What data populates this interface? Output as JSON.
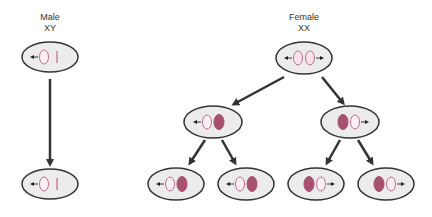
{
  "labels": {
    "male": {
      "title": "Male",
      "genotype": "XY"
    },
    "female": {
      "title": "Female",
      "genotype": "XX"
    }
  },
  "colors": {
    "cell_fill": "#ececec",
    "cell_stroke": "#333333",
    "x_active_fill": "#fbe3ea",
    "x_active_stroke": "#c06a88",
    "x_inactive_fill": "#a8506f",
    "arrow": "#333333"
  },
  "cells": [
    {
      "id": "male-parent",
      "cx": 50,
      "cy": 57,
      "sex": "male",
      "chromosomes": [
        "X-active",
        "Y"
      ],
      "arrow": "left"
    },
    {
      "id": "male-child",
      "cx": 50,
      "cy": 184,
      "sex": "male",
      "chromosomes": [
        "X-active",
        "Y"
      ],
      "arrow": "left"
    },
    {
      "id": "female-parent",
      "cx": 304,
      "cy": 58,
      "sex": "female",
      "chromosomes": [
        "X-active",
        "X-active"
      ],
      "arrow": "both"
    },
    {
      "id": "female-mid-left",
      "cx": 213,
      "cy": 122,
      "chromosomes": [
        "X-active",
        "X-inactive"
      ],
      "arrow": "left"
    },
    {
      "id": "female-mid-right",
      "cx": 350,
      "cy": 122,
      "chromosomes": [
        "X-inactive",
        "X-active"
      ],
      "arrow": "right"
    },
    {
      "id": "female-bottom-1",
      "cx": 176,
      "cy": 184,
      "chromosomes": [
        "X-active",
        "X-inactive"
      ],
      "arrow": "left"
    },
    {
      "id": "female-bottom-2",
      "cx": 246,
      "cy": 184,
      "chromosomes": [
        "X-active",
        "X-inactive"
      ],
      "arrow": "left"
    },
    {
      "id": "female-bottom-3",
      "cx": 316,
      "cy": 184,
      "chromosomes": [
        "X-inactive",
        "X-active"
      ],
      "arrow": "right"
    },
    {
      "id": "female-bottom-4",
      "cx": 386,
      "cy": 184,
      "chromosomes": [
        "X-inactive",
        "X-active"
      ],
      "arrow": "right"
    }
  ]
}
